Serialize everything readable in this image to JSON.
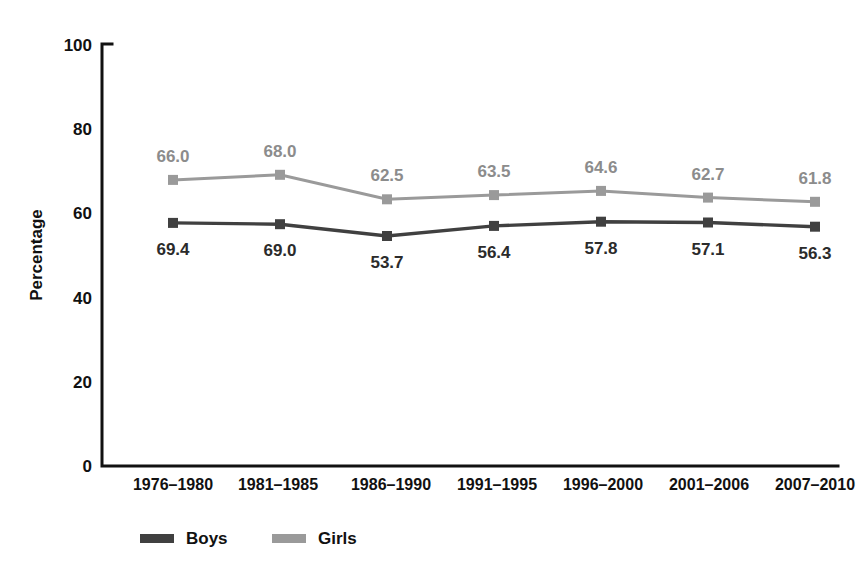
{
  "chart_data": {
    "type": "line",
    "title": "",
    "xlabel": "",
    "ylabel": "Percentage",
    "ylim": [
      0,
      100
    ],
    "yticks": [
      0,
      20,
      40,
      60,
      80,
      100
    ],
    "grid": false,
    "legend_position": "bottom-left",
    "categories": [
      "1976–1980",
      "1981–1985",
      "1986–1990",
      "1991–1995",
      "1996–2000",
      "2001–2006",
      "2007–2010"
    ],
    "series": [
      {
        "name": "Girls",
        "color": "#9a9a9a",
        "label_color": "#8c8c8c",
        "label_position": "above",
        "values": [
          67.8,
          69.0,
          63.2,
          64.2,
          65.2,
          63.6,
          62.6
        ],
        "labels": [
          "66.0",
          "68.0",
          "62.5",
          "63.5",
          "64.6",
          "62.7",
          "61.8"
        ]
      },
      {
        "name": "Boys",
        "color": "#404040",
        "label_color": "#2b2b2b",
        "label_position": "below",
        "values": [
          57.6,
          57.3,
          54.5,
          56.9,
          57.9,
          57.7,
          56.7
        ],
        "labels": [
          "69.4",
          "69.0",
          "53.7",
          "56.4",
          "57.8",
          "57.1",
          "56.3"
        ]
      }
    ]
  },
  "legend": {
    "items": [
      {
        "label": "Boys",
        "color": "#404040"
      },
      {
        "label": "Girls",
        "color": "#9a9a9a"
      }
    ]
  },
  "axes": {
    "y_axis_title": "Percentage",
    "y_tick_labels": [
      "100",
      "80",
      "60",
      "40",
      "20",
      "0"
    ],
    "x_tick_labels": [
      "1976–1980",
      "1981–1985",
      "1986–1990",
      "1991–1995",
      "1996–2000",
      "2001–2006",
      "2007–2010"
    ]
  }
}
